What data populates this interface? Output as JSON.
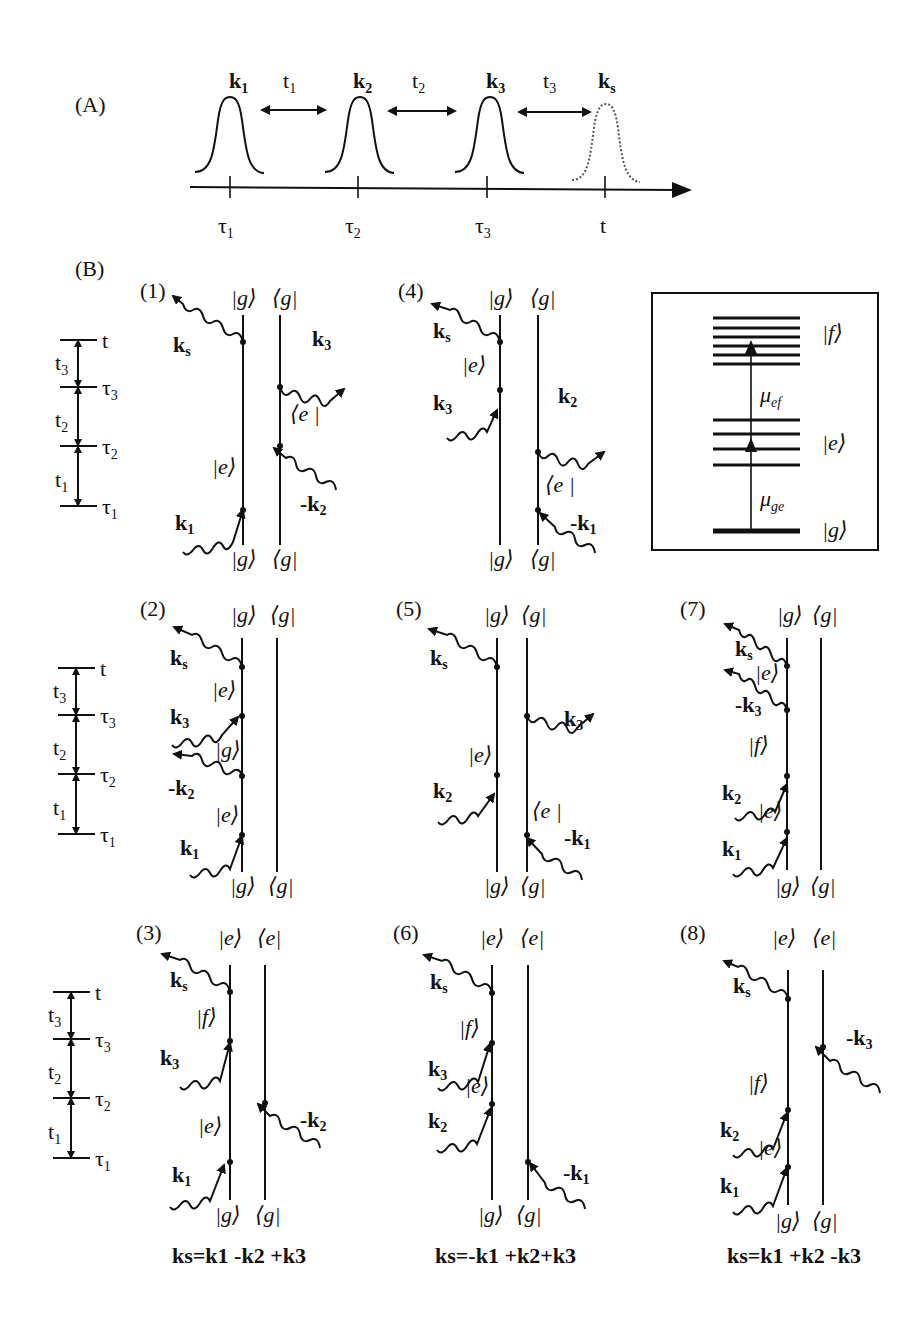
{
  "panel_a": {
    "label": "(A)",
    "pulses": [
      {
        "k": "k",
        "sub": "1",
        "time": "τ",
        "time_sub": "1"
      },
      {
        "k": "k",
        "sub": "2",
        "time": "τ",
        "time_sub": "2"
      },
      {
        "k": "k",
        "sub": "3",
        "time": "τ",
        "time_sub": "3"
      },
      {
        "k": "k",
        "sub": "s",
        "time": "t",
        "time_sub": ""
      }
    ],
    "delays": [
      {
        "t": "t",
        "sub": "1"
      },
      {
        "t": "t",
        "sub": "2"
      },
      {
        "t": "t",
        "sub": "3"
      }
    ]
  },
  "panel_b": {
    "label": "(B)",
    "timeline": {
      "times": [
        "t",
        "τ3",
        "τ2",
        "τ1"
      ],
      "intervals": [
        "t3",
        "t2",
        "t1"
      ]
    },
    "diagrams": [
      {
        "id": "(1)",
        "top": [
          "|g⟩",
          "⟨g|"
        ],
        "bottom": [
          "|g⟩",
          "⟨g|"
        ],
        "states": [
          "|e⟩",
          "⟨e|"
        ],
        "fields": [
          "ks",
          "k3",
          "-k2",
          "k1"
        ]
      },
      {
        "id": "(2)",
        "top": [
          "|g⟩",
          "⟨g|"
        ],
        "bottom": [
          "|g⟩",
          "⟨g|"
        ],
        "states": [
          "|e⟩",
          "|g⟩",
          "|e⟩"
        ],
        "fields": [
          "ks",
          "k3",
          "-k2",
          "k1"
        ]
      },
      {
        "id": "(3)",
        "top": [
          "|e⟩",
          "⟨e|"
        ],
        "bottom": [
          "|g⟩",
          "⟨g|"
        ],
        "states": [
          "|f⟩",
          "|e⟩"
        ],
        "fields": [
          "ks",
          "k3",
          "-k2",
          "k1"
        ]
      },
      {
        "id": "(4)",
        "top": [
          "|g⟩",
          "⟨g|"
        ],
        "bottom": [
          "|g⟩",
          "⟨g|"
        ],
        "states": [
          "|e⟩",
          "⟨e|"
        ],
        "fields": [
          "ks",
          "k3",
          "k2",
          "-k1"
        ]
      },
      {
        "id": "(5)",
        "top": [
          "|g⟩",
          "⟨g|"
        ],
        "bottom": [
          "|g⟩",
          "⟨g|"
        ],
        "states": [
          "|e⟩",
          "⟨e|"
        ],
        "fields": [
          "ks",
          "k3",
          "k2",
          "-k1"
        ]
      },
      {
        "id": "(6)",
        "top": [
          "|e⟩",
          "⟨e|"
        ],
        "bottom": [
          "|g⟩",
          "⟨g|"
        ],
        "states": [
          "|f⟩",
          "|e⟩"
        ],
        "fields": [
          "ks",
          "k3",
          "k2",
          "-k1"
        ]
      },
      {
        "id": "(7)",
        "top": [
          "|g⟩",
          "⟨g|"
        ],
        "bottom": [
          "|g⟩",
          "⟨g|"
        ],
        "states": [
          "|e⟩",
          "|f⟩",
          "|e⟩"
        ],
        "fields": [
          "ks",
          "-k3",
          "k2",
          "k1"
        ]
      },
      {
        "id": "(8)",
        "top": [
          "|e⟩",
          "⟨e|"
        ],
        "bottom": [
          "|g⟩",
          "⟨g|"
        ],
        "states": [
          "|f⟩",
          "|e⟩"
        ],
        "fields": [
          "ks",
          "-k3",
          "k2",
          "k1"
        ]
      }
    ],
    "energy_levels": {
      "levels": [
        "|f⟩",
        "|e⟩",
        "|g⟩"
      ],
      "transitions": [
        "μef",
        "μge"
      ],
      "f_lines": 6,
      "e_lines": 4,
      "g_lines": 1
    },
    "equations": [
      "ks=k1 -k2 +k3",
      "ks=-k1 +k2+k3",
      "ks=k1 +k2 -k3"
    ]
  }
}
